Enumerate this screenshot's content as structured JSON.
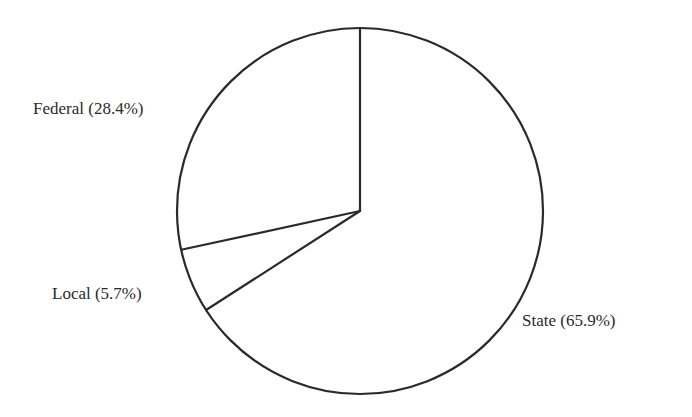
{
  "chart_data": {
    "type": "pie",
    "title": "",
    "categories": [
      "Federal",
      "Local",
      "State"
    ],
    "values": [
      28.4,
      5.7,
      65.9
    ],
    "unit": "%",
    "labels": [
      "Federal (28.4%)",
      "Local (5.7%)",
      "State (65.9%)"
    ],
    "start_angle": "12 o'clock",
    "direction": "counterclockwise",
    "fill": "none",
    "stroke": "#2a2a2a",
    "legend": "none (direct labels)"
  },
  "geometry": {
    "cx": 360,
    "cy": 211,
    "r": 183
  },
  "label_positions": [
    {
      "x": 33,
      "y": 114,
      "anchor": "start"
    },
    {
      "x": 52,
      "y": 299,
      "anchor": "start"
    },
    {
      "x": 522,
      "y": 326,
      "anchor": "start"
    }
  ],
  "colors": {
    "background": "#ffffff",
    "stroke": "#2a2a2a",
    "text": "#2a2a2a"
  }
}
